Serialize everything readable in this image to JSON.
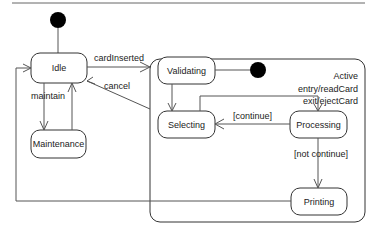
{
  "diagram": {
    "type": "UML state machine",
    "colors": {
      "line": "#555555",
      "border": "#333333",
      "text": "#222222",
      "pseudostate": "#000000",
      "background": "#ffffff"
    },
    "states": {
      "idle": {
        "label": "Idle"
      },
      "maintenance": {
        "label": "Maintenance"
      },
      "active": {
        "label": "Active",
        "entry": "entry/readCard",
        "exit": "exit/ejectCard",
        "substates": {
          "validating": {
            "label": "Validating"
          },
          "selecting": {
            "label": "Selecting"
          },
          "processing": {
            "label": "Processing"
          },
          "printing": {
            "label": "Printing"
          }
        }
      }
    },
    "transitions": {
      "card_inserted": {
        "label": "cardInserted",
        "from": "Idle",
        "to": "Active"
      },
      "cancel": {
        "label": "cancel",
        "from": "Active",
        "to": "Idle"
      },
      "maintain": {
        "label": "maintain",
        "from": "Idle",
        "to": "Maintenance"
      },
      "continue": {
        "label": "[continue]",
        "from": "Processing",
        "to": "Selecting"
      },
      "not_continue": {
        "label": "[not continue]",
        "from": "Processing",
        "to": "Printing"
      }
    }
  }
}
